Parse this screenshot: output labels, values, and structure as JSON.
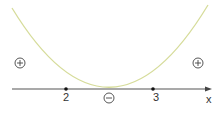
{
  "diagram": {
    "type": "sign-chart-parabola",
    "axis_label": "x",
    "roots": [
      {
        "value": "2"
      },
      {
        "value": "3"
      }
    ],
    "regions": [
      {
        "position": "left",
        "sign": "+"
      },
      {
        "position": "middle",
        "sign": "−"
      },
      {
        "position": "right",
        "sign": "+"
      }
    ],
    "colors": {
      "curve": "#d6dc9a",
      "axis": "#555555",
      "text": "#333333"
    }
  }
}
